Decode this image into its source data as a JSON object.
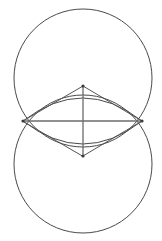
{
  "figure": {
    "background_color": "#ffffff",
    "canvas": {
      "width": 162,
      "height": 241
    },
    "stroke_colors": {
      "circle": "#4a4a4a",
      "chord": "#555555",
      "axis": "#6b6b6b",
      "vertex": "#3a3a3a"
    },
    "stroke_widths": {
      "circle": 1,
      "chord": 1,
      "axis": 1.3
    },
    "circles": [
      {
        "name": "upper-circle",
        "cx": 83,
        "cy": 78,
        "r": 69
      },
      {
        "name": "lower-circle",
        "cx": 83,
        "cy": 164,
        "r": 69
      }
    ],
    "intersection_points": [
      {
        "name": "left-vertex",
        "x": 23,
        "y": 121
      },
      {
        "name": "right-vertex",
        "x": 142,
        "y": 121
      }
    ],
    "lens": {
      "name": "vesica-lens",
      "left": {
        "x": 23,
        "y": 121
      },
      "right": {
        "x": 142,
        "y": 121
      },
      "top": {
        "x": 83,
        "y": 86
      },
      "bottom": {
        "x": 83,
        "y": 156
      },
      "upper_arc_path": "M 23 121 Q 83 75 142 121",
      "lower_arc_path": "M 23 121 Q 83 167 142 121"
    },
    "rhombus": {
      "name": "inscribed-rhombus",
      "points": "23,121 83,86 142,121 83,156",
      "edges": [
        {
          "name": "edge-left-top",
          "x1": 23,
          "y1": 121,
          "x2": 83,
          "y2": 86
        },
        {
          "name": "edge-top-right",
          "x1": 83,
          "y1": 86,
          "x2": 142,
          "y2": 121
        },
        {
          "name": "edge-right-bottom",
          "x1": 142,
          "y1": 121,
          "x2": 83,
          "y2": 156
        },
        {
          "name": "edge-bottom-left",
          "x1": 83,
          "y1": 156,
          "x2": 23,
          "y2": 121
        }
      ]
    },
    "diagonals": [
      {
        "name": "horizontal-diagonal",
        "x1": 23,
        "y1": 121,
        "x2": 142,
        "y2": 121
      },
      {
        "name": "vertical-diagonal",
        "x1": 83,
        "y1": 86,
        "x2": 83,
        "y2": 156
      }
    ],
    "center_point": {
      "name": "figure-center",
      "x": 83,
      "y": 121
    },
    "vertex_markers": [
      {
        "name": "marker-left",
        "x": 23,
        "y": 121,
        "r": 1.6
      },
      {
        "name": "marker-right",
        "x": 142,
        "y": 121,
        "r": 1.6
      },
      {
        "name": "marker-top",
        "x": 83,
        "y": 86,
        "r": 1.6
      },
      {
        "name": "marker-bottom",
        "x": 83,
        "y": 156,
        "r": 1.6
      }
    ]
  }
}
